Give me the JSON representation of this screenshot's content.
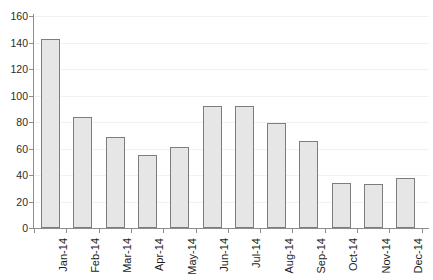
{
  "chart_data": {
    "type": "bar",
    "title": "",
    "subtitle": "",
    "xlabel": "",
    "ylabel": "",
    "categories": [
      "Jan-14",
      "Feb-14",
      "Mar-14",
      "Apr-14",
      "May-14",
      "Jun-14",
      "Jul-14",
      "Aug-14",
      "Sep-14",
      "Oct-14",
      "Nov-14",
      "Dec-14"
    ],
    "values": [
      143,
      84,
      69,
      55,
      61,
      92,
      92,
      79,
      66,
      34,
      33,
      38
    ],
    "ylim": [
      0,
      160
    ],
    "yticks": [
      0,
      20,
      40,
      60,
      80,
      100,
      120,
      140,
      160
    ],
    "ytick_labels": [
      "0",
      "20",
      "40",
      "60",
      "80",
      "100",
      "120",
      "140",
      "160"
    ],
    "grid": true,
    "legend": false,
    "legend_position": "none",
    "bar_fill_color": "#e6e6e6",
    "bar_border_color": "#7d7d7d",
    "axis_color": "#8d8d8d",
    "grid_color": "#f1f1f1",
    "xlabel_rotation": -90
  }
}
